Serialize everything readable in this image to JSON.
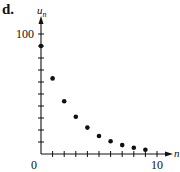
{
  "panel_label": "d.",
  "chart_data": {
    "type": "scatter",
    "title": "",
    "xlabel": "n",
    "ylabel": "u_n",
    "ylabel_main": "u",
    "ylabel_sub": "n",
    "x": [
      0,
      1,
      2,
      3,
      4,
      5,
      6,
      7,
      8,
      9
    ],
    "values": [
      90,
      63,
      44,
      31,
      22,
      15,
      10.6,
      7.4,
      5.2,
      3.6
    ],
    "xlim": [
      0,
      11
    ],
    "ylim": [
      0,
      110
    ],
    "x_tick_step": 1,
    "y_tick_step": 10,
    "x_tick_labels": [
      {
        "value": 0,
        "label": "0"
      },
      {
        "value": 10,
        "label": "10"
      }
    ],
    "y_tick_labels": [
      {
        "value": 100,
        "label": "100"
      }
    ],
    "grid": false,
    "legend": null,
    "marker_color": "#111111"
  }
}
